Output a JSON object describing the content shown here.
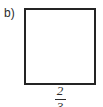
{
  "figure": {
    "part_label": "b)",
    "shape": "square",
    "colors": {
      "stroke": "#242424",
      "fill": "#ffffff",
      "text": "#2b2b2b",
      "background": "#ffffff"
    },
    "side_length_label": {
      "numerator": "2",
      "denominator": "3",
      "display": "2/3",
      "position": "below",
      "clipped": "denominator partially cut off at bottom image edge"
    }
  }
}
